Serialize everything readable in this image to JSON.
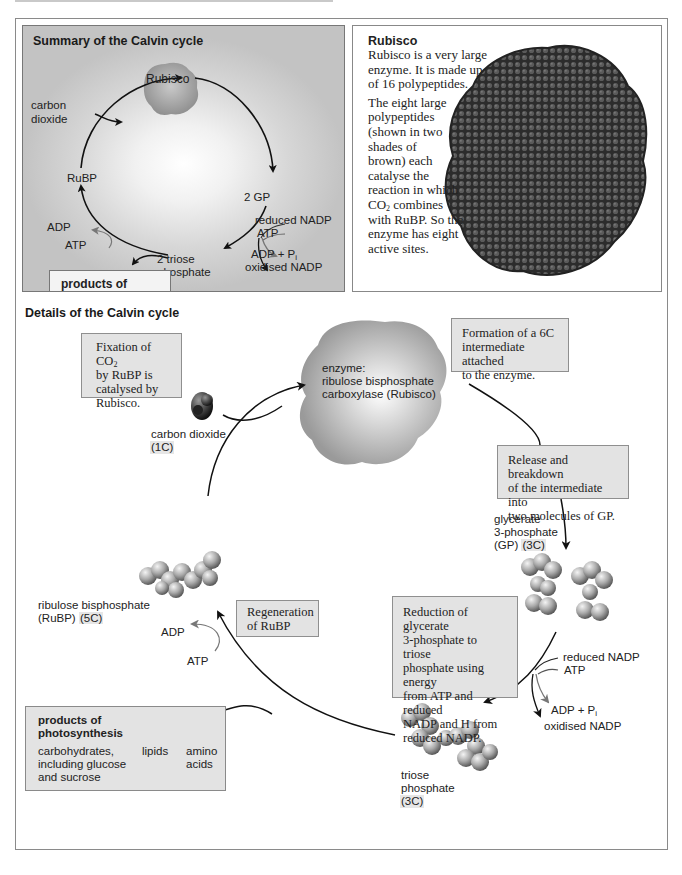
{
  "summary": {
    "title": "Summary of the Calvin cycle",
    "rubisco": "Rubisco",
    "carbon_dioxide_1": "carbon",
    "carbon_dioxide_2": "dioxide",
    "rubp": "RuBP",
    "gp": "2 GP",
    "reduced_nadp": "reduced NADP",
    "atp_in": "ATP",
    "adp_pi": "ADP + P",
    "adp_pi_sub": "i",
    "oxidised_nadp": "oxidised NADP",
    "triose_1": "2 triose",
    "triose_2": "phosphate",
    "adp": "ADP",
    "atp": "ATP",
    "products_1": "products of",
    "products_2": "photosynthesis"
  },
  "rubisco_info": {
    "heading": "Rubisco",
    "p1_l1": "Rubisco is a very large",
    "p1_l2": "enzyme. It is made up",
    "p1_l3": "of 16 polypeptides.",
    "p2_l1": "The eight large",
    "p2_l2": "polypeptides",
    "p2_l3": "(shown in two",
    "p2_l4": "shades of",
    "p2_l5": "brown) each",
    "p2_l6": "catalyse the",
    "p2_l7": "reaction in which",
    "p2_l8_pre": "CO",
    "p2_l8_sub": "2",
    "p2_l8_post": " combines",
    "p2_l9": "with RuBP. So the",
    "p2_l10": "enzyme has eight",
    "p2_l11": "active sites."
  },
  "details": {
    "title": "Details of the Calvin cycle",
    "fixation_note": {
      "l1_pre": "Fixation of CO",
      "l1_sub": "2",
      "l2": "by RuBP is",
      "l3": "catalysed by",
      "l4": "Rubisco."
    },
    "co2_label": "carbon dioxide",
    "co2_carbons": "(1C)",
    "enzyme_l1": "enzyme:",
    "enzyme_l2": "ribulose bisphosphate",
    "enzyme_l3": "carboxylase (Rubisco)",
    "formation_note": {
      "l1": "Formation of a 6C",
      "l2": "intermediate attached",
      "l3": "to the enzyme."
    },
    "release_note": {
      "l1": "Release and breakdown",
      "l2": "of the intermediate into",
      "l3": "two molecules of GP."
    },
    "gp_l1": "glycerate",
    "gp_l2": "3-phosphate",
    "gp_l3": "(GP)",
    "gp_carbons": "(3C)",
    "reduction_note": {
      "l1": "Reduction of glycerate",
      "l2": "3-phosphate to triose",
      "l3": "phosphate using energy",
      "l4": "from ATP and reduced",
      "l5": "NADP and H from",
      "l6": "reduced NADP."
    },
    "reduced_nadp": "reduced NADP",
    "atp_in": "ATP",
    "adp_pi": "ADP + P",
    "adp_pi_sub": "i",
    "oxidised_nadp": "oxidised NADP",
    "triose_l1": "triose",
    "triose_l2": "phosphate",
    "triose_carbons": "(3C)",
    "rubp_l1": "ribulose bisphosphate",
    "rubp_l2": "(RuBP)",
    "rubp_carbons": "(5C)",
    "regeneration_note": {
      "l1": "Regeneration",
      "l2": "of RuBP"
    },
    "adp": "ADP",
    "atp": "ATP",
    "products": {
      "title_l1": "products of",
      "title_l2": "photosynthesis",
      "carbs_l1": "carbohydrates,",
      "carbs_l2": "including glucose",
      "carbs_l3": "and sucrose",
      "lipids": "lipids",
      "amino_l1": "amino",
      "amino_l2": "acids"
    }
  },
  "colors": {
    "note_bg": "#e3e3e3",
    "frame_border": "#8a8a8a",
    "summary_bg_edge": "#c3c3c3",
    "rubisco_protein": "#3a3a3a"
  }
}
